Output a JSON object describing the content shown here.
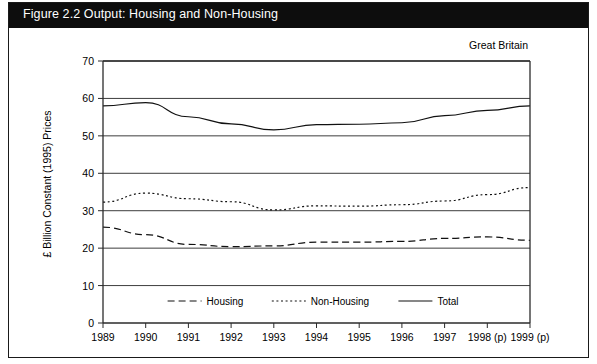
{
  "figure": {
    "title": "Figure 2.2  Output: Housing and Non-Housing",
    "region_label": "Great Britain"
  },
  "chart_data": {
    "type": "line",
    "title": "Figure 2.2  Output: Housing and Non-Housing",
    "xlabel": "",
    "ylabel": "£ Billion Constant (1995) Prices",
    "annotation": "Great Britain",
    "categories": [
      "1989",
      "1990",
      "1991",
      "1992",
      "1993",
      "1994",
      "1995",
      "1996",
      "1997",
      "1998 (p)",
      "1999 (p)"
    ],
    "x_tick_labels": [
      "1989",
      "1990",
      "1991",
      "1992",
      "1993",
      "1994",
      "1995",
      "1996",
      "1997",
      "1998 (p)",
      "1999 (p)"
    ],
    "y_ticks": [
      0,
      10,
      20,
      30,
      40,
      50,
      60,
      70
    ],
    "ylim": [
      0,
      70
    ],
    "grid": true,
    "grid_axis": "y",
    "legend_position": "bottom-center",
    "series": [
      {
        "name": "Housing",
        "style": "dashed",
        "values": [
          25.6,
          23.6,
          21.0,
          20.4,
          20.6,
          21.6,
          21.6,
          21.8,
          22.6,
          23.0,
          22.1
        ]
      },
      {
        "name": "Non-Housing",
        "style": "dotted",
        "values": [
          32.3,
          34.7,
          33.2,
          32.4,
          30.2,
          31.3,
          31.2,
          31.6,
          32.6,
          34.3,
          36.2
        ]
      },
      {
        "name": "Total",
        "style": "solid",
        "values": [
          58.0,
          58.9,
          55.1,
          53.2,
          51.6,
          53.0,
          53.1,
          53.5,
          55.4,
          56.8,
          58.0
        ]
      }
    ]
  },
  "legend": {
    "items": [
      {
        "label": "Housing",
        "style": "dashed"
      },
      {
        "label": "Non-Housing",
        "style": "dotted"
      },
      {
        "label": "Total",
        "style": "solid"
      }
    ]
  }
}
